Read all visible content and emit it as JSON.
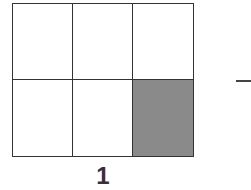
{
  "figure": {
    "grid": {
      "rows": 2,
      "columns": 3,
      "total_parts": 6,
      "shaded_parts": 1,
      "shaded_cells": [
        [
          2,
          3
        ]
      ],
      "line_color": "#333333",
      "shade_color": "#8a8a8a"
    },
    "label": "1",
    "trailing_symbol": "—"
  }
}
